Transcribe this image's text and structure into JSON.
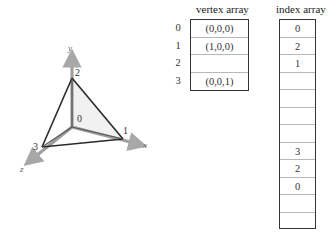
{
  "tetrahedron": {
    "axes": {
      "x_label": "x",
      "y_label": "y",
      "z_label": "z"
    },
    "vertices": [
      {
        "id": "0",
        "label": "0"
      },
      {
        "id": "1",
        "label": "1"
      },
      {
        "id": "2",
        "label": "2"
      },
      {
        "id": "3",
        "label": "3"
      }
    ],
    "colors": {
      "edge": "#2a2a2a",
      "axis": "#9a9a9a",
      "face": "#ececec"
    }
  },
  "vertex_array": {
    "title": "vertex array",
    "rows": [
      {
        "index": "0",
        "value": "(0,0,0)"
      },
      {
        "index": "1",
        "value": "(1,0,0)"
      },
      {
        "index": "2",
        "value": ""
      },
      {
        "index": "3",
        "value": "(0,0,1)"
      }
    ]
  },
  "index_array": {
    "title": "index array",
    "rows": [
      "0",
      "2",
      "1",
      "",
      "",
      "",
      "",
      "3",
      "2",
      "0",
      "",
      ""
    ]
  }
}
